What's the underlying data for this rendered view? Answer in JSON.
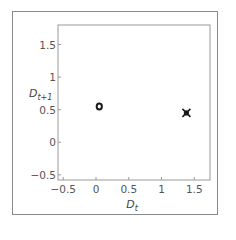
{
  "chart_data": {
    "type": "scatter",
    "title": "",
    "xlabel": "D",
    "xlabel_sub": "t",
    "ylabel": "D",
    "ylabel_sub": "t+1",
    "xlim": [
      -0.58,
      1.74
    ],
    "ylim": [
      -0.58,
      1.8
    ],
    "xticks": [
      -0.5,
      0,
      0.5,
      1,
      1.5
    ],
    "xtick_labels": [
      "−0.5",
      "0",
      "0.5",
      "1",
      "1.5"
    ],
    "yticks": [
      -0.5,
      0,
      0.5,
      1,
      1.5
    ],
    "ytick_labels": [
      "−0.5",
      "0",
      "0.5",
      "1",
      "1.5"
    ],
    "grid": false,
    "series": [
      {
        "name": "cluster-1",
        "marker": "ring",
        "points": [
          [
            0.05,
            0.55
          ]
        ]
      },
      {
        "name": "cluster-2",
        "marker": "star",
        "points": [
          [
            1.38,
            0.45
          ]
        ]
      }
    ],
    "colors": {
      "axis": "#9a9a9a",
      "marker": "#1a1a1a"
    }
  }
}
